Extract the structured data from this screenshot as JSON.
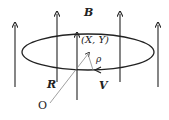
{
  "diagram": {
    "labels": {
      "field": "B",
      "guiding_center": "(X, Y)",
      "gyroradius": "ρ",
      "position_vector": "R",
      "velocity": "V",
      "origin": "O"
    },
    "colors": {
      "stroke": "#222222",
      "thin_line": "#888888",
      "background": "#ffffff"
    },
    "field_arrows_x": [
      15,
      57,
      77,
      120,
      158
    ]
  }
}
